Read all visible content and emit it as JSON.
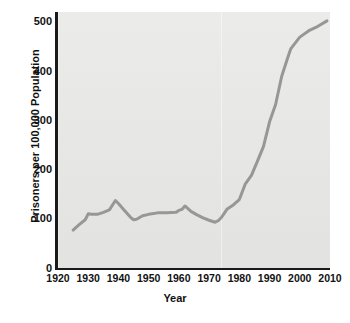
{
  "chart_data": {
    "type": "line",
    "title": "",
    "xlabel": "Year",
    "ylabel": "Prisoners per 100,000 Population",
    "xlim": [
      1920,
      2010
    ],
    "ylim": [
      0,
      520
    ],
    "grid": false,
    "legend": null,
    "xticks": [
      1920,
      1930,
      1940,
      1950,
      1960,
      1970,
      1980,
      1990,
      2000,
      2010
    ],
    "yticks": [
      0,
      100,
      200,
      300,
      400,
      500
    ],
    "xtick_labels": [
      "1920",
      "1930",
      "1940",
      "1950",
      "1960",
      "1970",
      "1980",
      "1990",
      "2000",
      "2010"
    ],
    "ytick_labels": [
      "0",
      "100",
      "200",
      "300",
      "400",
      "500"
    ],
    "series": [
      {
        "name": "Imprisonment rate",
        "color": "#999795",
        "line_width": 3,
        "x": [
          1925,
          1927,
          1929,
          1930,
          1931,
          1933,
          1935,
          1937,
          1939,
          1940,
          1942,
          1944,
          1945,
          1946,
          1948,
          1950,
          1953,
          1956,
          1959,
          1960,
          1961,
          1962,
          1964,
          1966,
          1968,
          1970,
          1972,
          1973,
          1974,
          1975,
          1976,
          1978,
          1980,
          1982,
          1984,
          1986,
          1988,
          1990,
          1992,
          1994,
          1996,
          1997,
          2000,
          2003,
          2006,
          2009
        ],
        "y": [
          77,
          88,
          98,
          110,
          109,
          109,
          113,
          118,
          137,
          131,
          117,
          103,
          98,
          99,
          106,
          109,
          112,
          112,
          113,
          117,
          119,
          126,
          115,
          108,
          102,
          97,
          93,
          96,
          102,
          111,
          120,
          128,
          139,
          171,
          188,
          217,
          247,
          297,
          332,
          389,
          427,
          445,
          469,
          482,
          491,
          502
        ]
      }
    ],
    "annotations": []
  },
  "axes": {
    "y_title": "Prisoners per 100,000 Population",
    "x_title": "Year"
  },
  "style": {
    "plot_background": "#e7e7e5",
    "page_background": "#ffffff",
    "axis_color": "#1a1a1a",
    "line_color": "#999795",
    "tick_text_color": "#121212"
  }
}
